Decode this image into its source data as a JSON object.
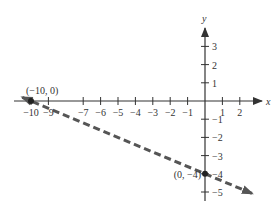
{
  "chart_data": {
    "type": "line",
    "title": "",
    "xlabel": "x",
    "ylabel": "y",
    "xlim": [
      -10.5,
      2.5
    ],
    "ylim": [
      -5.5,
      3.8
    ],
    "grid": false,
    "x_ticks": [
      -10,
      -9,
      -7,
      -6,
      -5,
      -4,
      -3,
      -2,
      -1,
      1,
      2
    ],
    "x_tick_labels": [
      "−10",
      "−9",
      "−7",
      "−6",
      "−5",
      "−4",
      "−3",
      "−2",
      "−1",
      "1",
      "2"
    ],
    "y_ticks": [
      3,
      2,
      1,
      -1,
      -2,
      -3,
      -4,
      -5
    ],
    "y_tick_labels": [
      "3",
      "2",
      "1",
      "−1",
      "−2",
      "−3",
      "−4",
      "−5"
    ],
    "series": [
      {
        "name": "line",
        "style": "dashed",
        "color": "#555555",
        "slope": -0.4,
        "intercept": -4,
        "x": [
          -10.5,
          2.7
        ],
        "y": [
          0.2,
          -5.08
        ]
      }
    ],
    "points": [
      {
        "x": -10,
        "y": 0,
        "label": "(−10, 0)"
      },
      {
        "x": 0,
        "y": -4,
        "label": "(0, −4)"
      }
    ]
  },
  "labels": {
    "x_axis": "x",
    "y_axis": "y",
    "point_a": "(−10, 0)",
    "point_b": "(0, −4)"
  }
}
